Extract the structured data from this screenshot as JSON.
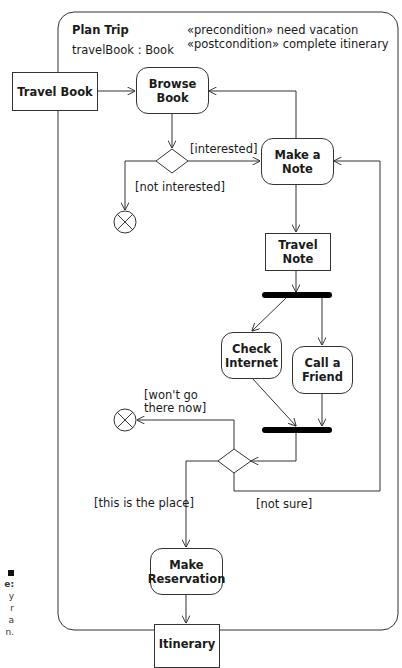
{
  "activity": {
    "name": "Plan Trip",
    "parameter": "travelBook : Book",
    "precondition": "«precondition» need vacation",
    "postcondition": "«postcondition» complete itinerary"
  },
  "objects": {
    "travel_book": "Travel Book",
    "travel_note_line1": "Travel",
    "travel_note_line2": "Note",
    "itinerary": "Itinerary"
  },
  "actions": {
    "browse_book_line1": "Browse",
    "browse_book_line2": "Book",
    "make_note_line1": "Make a",
    "make_note_line2": "Note",
    "check_internet_line1": "Check",
    "check_internet_line2": "Internet",
    "call_friend_line1": "Call a",
    "call_friend_line2": "Friend",
    "make_reservation_line1": "Make",
    "make_reservation_line2": "Reservation"
  },
  "guards": {
    "interested": "[interested]",
    "not_interested": "[not interested]",
    "wont_go_line1": "[won't go",
    "wont_go_line2": "there now]",
    "this_is_the_place": "[this is the place]",
    "not_sure": "[not sure]"
  },
  "caption_fragment": [
    "e:",
    "y",
    "r",
    "a",
    "n."
  ],
  "colors": {
    "line": "#333333",
    "bar": "#000000",
    "background": "#ffffff"
  }
}
